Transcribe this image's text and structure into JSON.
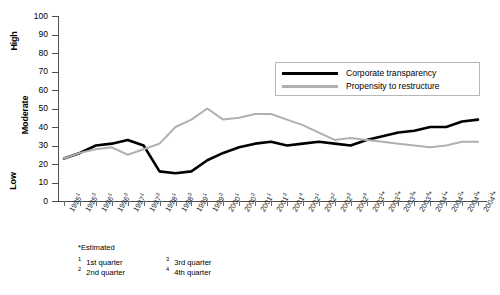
{
  "chart_data": {
    "type": "line",
    "title": "",
    "xlabel": "",
    "ylabel": "",
    "ylim": [
      0,
      100
    ],
    "ytick_values": [
      0,
      10,
      20,
      30,
      40,
      50,
      60,
      70,
      80,
      90,
      100
    ],
    "y_band_labels": [
      {
        "label": "High",
        "approx_value": 85
      },
      {
        "label": "Moderate",
        "approx_value": 50
      },
      {
        "label": "Low",
        "approx_value": 12
      }
    ],
    "grid": false,
    "legend_position": "upper-right-inside",
    "categories": [
      "1995¹",
      "1995³",
      "1996¹",
      "1996³",
      "1997¹",
      "1997³",
      "1998¹",
      "1998³",
      "1999¹",
      "1999³",
      "2000¹",
      "2000³",
      "2001¹",
      "2001³",
      "2001⁴",
      "2002¹",
      "2002²",
      "2002³",
      "2002⁴",
      "2003¹*",
      "2003²*",
      "2003³*",
      "2003⁴*",
      "2004¹*",
      "2004²*",
      "2004³*",
      "2004⁴*"
    ],
    "series": [
      {
        "name": "Corporate transparency",
        "color": "#000000",
        "values": [
          23,
          26,
          30,
          31,
          33,
          30,
          16,
          15,
          16,
          22,
          26,
          29,
          31,
          32,
          30,
          31,
          32,
          31,
          30,
          33,
          35,
          37,
          38,
          40,
          40,
          43,
          44
        ]
      },
      {
        "name": "Propensity to restructure",
        "color": "#b0b0b0",
        "values": [
          23,
          26,
          28,
          29,
          25,
          28,
          31,
          40,
          44,
          50,
          44,
          45,
          47,
          47,
          44,
          41,
          37,
          33,
          34,
          33,
          32,
          31,
          30,
          29,
          30,
          32,
          32
        ]
      }
    ]
  },
  "legend": {
    "items": [
      {
        "label": "Corporate transparency",
        "swatch": "black"
      },
      {
        "label": "Propensity to restructure",
        "swatch": "gray"
      }
    ]
  },
  "footnotes": {
    "estimated": "*Estimated",
    "items": [
      {
        "num": "1",
        "text": "1st quarter"
      },
      {
        "num": "2",
        "text": "2nd quarter"
      },
      {
        "num": "3",
        "text": "3rd quarter"
      },
      {
        "num": "4",
        "text": "4th quarter"
      }
    ]
  },
  "source": ""
}
